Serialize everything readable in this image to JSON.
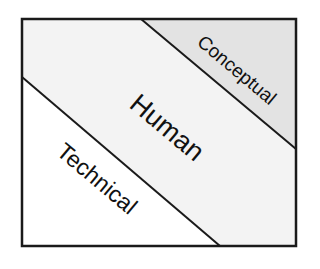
{
  "diagram": {
    "type": "layered-regions",
    "regions": [
      {
        "id": "conceptual",
        "label": "Conceptual",
        "fill": "#e3e3e3",
        "order": "top-right"
      },
      {
        "id": "human",
        "label": "Human",
        "fill": "#f3f3f3",
        "order": "middle"
      },
      {
        "id": "technical",
        "label": "Technical",
        "fill": "#ffffff",
        "order": "bottom-left"
      }
    ],
    "colors": {
      "border": "#1a1a1a",
      "text": "#111111",
      "background": "#ffffff"
    }
  }
}
